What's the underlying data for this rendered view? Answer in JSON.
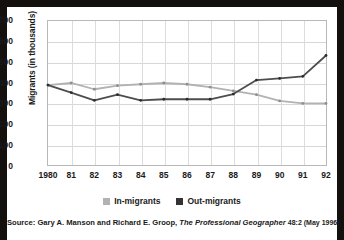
{
  "chart_data": {
    "type": "line",
    "title": "",
    "xlabel": "",
    "ylabel": "Migrants (in thousands)",
    "categories": [
      "1980",
      "81",
      "82",
      "83",
      "84",
      "85",
      "86",
      "87",
      "88",
      "89",
      "90",
      "91",
      "92"
    ],
    "ylim": [
      0,
      700
    ],
    "yticks": [
      0,
      100,
      200,
      300,
      400,
      500,
      600,
      700
    ],
    "grid": true,
    "legend_position": "bottom",
    "series": [
      {
        "name": "In-migrants",
        "color": "#b2b2b2",
        "values": [
          388,
          398,
          368,
          385,
          392,
          398,
          392,
          378,
          360,
          342,
          312,
          300,
          300
        ]
      },
      {
        "name": "Out-migrants",
        "color": "#4d4d4d",
        "values": [
          388,
          352,
          315,
          342,
          315,
          320,
          320,
          320,
          345,
          412,
          420,
          430,
          530
        ]
      }
    ]
  },
  "axis": {
    "y_label": "Migrants (in thousands)",
    "y_ticks": [
      "700",
      "600",
      "500",
      "400",
      "300",
      "200",
      "100",
      "0"
    ],
    "x_ticks": [
      "1980",
      "81",
      "82",
      "83",
      "84",
      "85",
      "86",
      "87",
      "88",
      "89",
      "90",
      "91",
      "92"
    ]
  },
  "legend": {
    "items": [
      {
        "label": "In-migrants",
        "color": "#b2b2b2"
      },
      {
        "label": "Out-migrants",
        "color": "#333333"
      }
    ]
  },
  "source": {
    "prefix": "Source: Gary A. Manson and Richard E. Groop,",
    "journal": "The Professional Geographer",
    "suffix": "48:2 (May 1996)"
  }
}
